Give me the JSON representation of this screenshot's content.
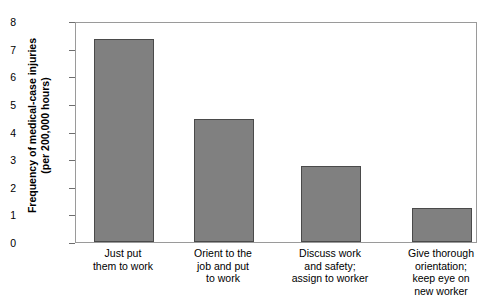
{
  "chart_data": {
    "type": "bar",
    "title": "",
    "xlabel": "",
    "ylabel": "Frequency of medical-case injuries (per 200,000 hours)",
    "ylabel_lines": [
      "Frequency of medical-case injuries",
      "(per 200,000 hours)"
    ],
    "ylim": [
      0,
      8
    ],
    "yticks": [
      8,
      7,
      6,
      5,
      4,
      3,
      2,
      1,
      0
    ],
    "grid": false,
    "legend": null,
    "bar_color": "#808080",
    "bar_edge_color": "#4a4a4a",
    "frame_color": "#9a9a9a",
    "categories": [
      "Just put them to work",
      "Orient to the job and put to work",
      "Discuss work and safety; assign to worker",
      "Give thorough orientation; keep eye on new worker"
    ],
    "category_lines": [
      [
        "Just put",
        "them to work"
      ],
      [
        "Orient to the",
        "job and put",
        "to work"
      ],
      [
        "Discuss work",
        "and safety;",
        "assign to worker"
      ],
      [
        "Give thorough",
        "orientation;",
        "keep eye on",
        "new worker"
      ]
    ],
    "values": [
      7.35,
      4.45,
      2.75,
      1.23
    ]
  }
}
